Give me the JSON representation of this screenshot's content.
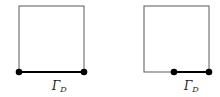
{
  "figure": {
    "name": "dirichlet-boundary-diagram",
    "background_color": "#ffffff",
    "width": 220,
    "height": 97,
    "edge_color": "#555555",
    "bold_color": "#000000",
    "label_color": "#1a1a1a"
  },
  "panels": [
    {
      "id": "left",
      "name": "full-bottom-edge-square",
      "square": {
        "x": 19,
        "y": 6,
        "width": 65,
        "height": 66
      },
      "bold_segment": {
        "x1": 19,
        "y1": 72,
        "x2": 84,
        "y2": 72
      },
      "nodes": [
        {
          "name": "node-bottom-left",
          "cx": 19,
          "cy": 72,
          "r": 3.2
        },
        {
          "name": "node-bottom-right",
          "cx": 84,
          "cy": 72,
          "r": 3.2
        }
      ],
      "label": {
        "gamma": "Γ",
        "subscript": "D"
      }
    },
    {
      "id": "right",
      "name": "half-bottom-edge-square",
      "square": {
        "x": 144,
        "y": 6,
        "width": 65,
        "height": 66
      },
      "bold_segment": {
        "x1": 174,
        "y1": 72,
        "x2": 209,
        "y2": 72
      },
      "nodes": [
        {
          "name": "node-bottom-middle",
          "cx": 174,
          "cy": 72,
          "r": 3.2
        },
        {
          "name": "node-bottom-right",
          "cx": 209,
          "cy": 72,
          "r": 3.2
        }
      ],
      "label": {
        "gamma": "Γ",
        "subscript": "D"
      }
    }
  ]
}
